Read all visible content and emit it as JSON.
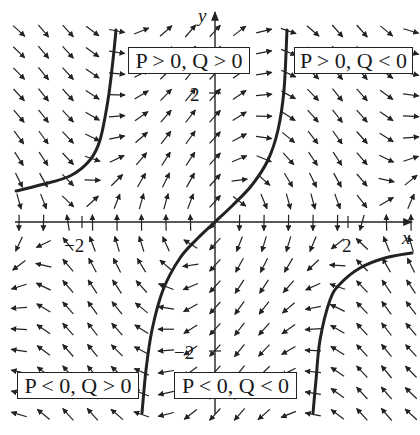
{
  "figure": {
    "type": "direction-field",
    "axes": {
      "x_label": "x",
      "y_label": "y",
      "x_ticks": [
        {
          "value": -2,
          "label": "−2"
        },
        {
          "value": 2,
          "label": "2"
        }
      ],
      "y_ticks": [
        {
          "value": 2,
          "label": "2"
        },
        {
          "value": -2,
          "label": "−2"
        }
      ],
      "xlim": [
        -3,
        3
      ],
      "ylim": [
        -3,
        3
      ]
    },
    "region_labels": [
      {
        "id": "pq-pos-pos",
        "text": "P > 0, Q > 0"
      },
      {
        "id": "pq-pos-neg",
        "text": "P > 0, Q < 0"
      },
      {
        "id": "pq-neg-pos",
        "text": "P < 0, Q > 0"
      },
      {
        "id": "pq-neg-neg",
        "text": "P < 0, Q < 0"
      }
    ],
    "nullclines": [
      {
        "name": "upper-left-curve",
        "points": [
          [
            16,
            191
          ],
          [
            40,
            185
          ],
          [
            70,
            176
          ],
          [
            90,
            160
          ],
          [
            100,
            140
          ],
          [
            108,
            100
          ],
          [
            113,
            60
          ],
          [
            116,
            30
          ]
        ]
      },
      {
        "name": "middle-curve",
        "points": [
          [
            142,
            413
          ],
          [
            146,
            370
          ],
          [
            152,
            330
          ],
          [
            163,
            290
          ],
          [
            180,
            258
          ],
          [
            198,
            238
          ],
          [
            215,
            222
          ],
          [
            233,
            205
          ],
          [
            252,
            185
          ],
          [
            268,
            160
          ],
          [
            278,
            130
          ],
          [
            284,
            90
          ],
          [
            287,
            30
          ]
        ]
      },
      {
        "name": "lower-right-curve",
        "points": [
          [
            313,
            413
          ],
          [
            316,
            380
          ],
          [
            320,
            340
          ],
          [
            330,
            300
          ],
          [
            340,
            284
          ],
          [
            360,
            268
          ],
          [
            385,
            258
          ],
          [
            412,
            253
          ]
        ]
      }
    ],
    "colors": {
      "ink": "#222222",
      "background": "#ffffff"
    }
  }
}
